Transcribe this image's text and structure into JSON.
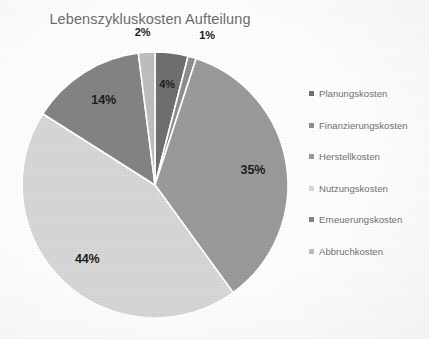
{
  "chart_data": {
    "type": "pie",
    "title": "Lebenszykluskosten Aufteilung",
    "xlabel": "",
    "ylabel": "",
    "legend_position": "right",
    "grid": false,
    "start_angle_deg": 0,
    "direction": "clockwise",
    "categories": [
      "Planungskosten",
      "Finanzierungskosten",
      "Herstellkosten",
      "Nutzungskosten",
      "Erneuerungskosten",
      "Abbruchkosten"
    ],
    "values": [
      4,
      1,
      35,
      44,
      14,
      2
    ],
    "labels": [
      "4%",
      "1%",
      "35%",
      "44%",
      "14%",
      "2%"
    ],
    "colors": [
      "#6f6f6f",
      "#8d8d8d",
      "#9a9a9a",
      "#d6d6d6",
      "#838383",
      "#bdbdbd"
    ],
    "slices": [
      {
        "name": "Planungskosten",
        "value": 4,
        "label": "4%",
        "color": "#6f6f6f"
      },
      {
        "name": "Finanzierungskosten",
        "value": 1,
        "label": "1%",
        "color": "#8d8d8d"
      },
      {
        "name": "Herstellkosten",
        "value": 35,
        "label": "35%",
        "color": "#9a9a9a"
      },
      {
        "name": "Nutzungskosten",
        "value": 44,
        "label": "44%",
        "color": "#d6d6d6"
      },
      {
        "name": "Erneuerungskosten",
        "value": 14,
        "label": "14%",
        "color": "#838383"
      },
      {
        "name": "Abbruchkosten",
        "value": 2,
        "label": "2%",
        "color": "#bdbdbd"
      }
    ]
  },
  "title": {
    "text": "Lebenszykluskosten Aufteilung",
    "color": "#6d6d6d"
  },
  "legend": {
    "items": [
      {
        "label": "Planungskosten",
        "color": "#6f6f6f"
      },
      {
        "label": "Finanzierungskosten",
        "color": "#8d8d8d"
      },
      {
        "label": "Herstellkosten",
        "color": "#9a9a9a"
      },
      {
        "label": "Nutzungskosten",
        "color": "#d6d6d6"
      },
      {
        "label": "Erneuerungskosten",
        "color": "#838383"
      },
      {
        "label": "Abbruchkosten",
        "color": "#bdbdbd"
      }
    ]
  },
  "geometry": {
    "center_x": 155,
    "center_y": 185,
    "radius": 133,
    "separator_color": "#ffffff",
    "background": "#fdfdfd"
  },
  "data_labels": {
    "color": "#1d1d1d",
    "values": [
      "4%",
      "1%",
      "35%",
      "44%",
      "14%",
      "2%"
    ]
  }
}
